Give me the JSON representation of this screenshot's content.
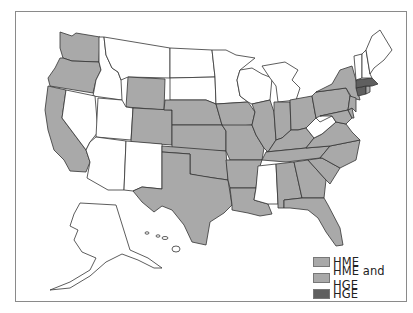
{
  "map": {
    "title": "",
    "region": "United States",
    "colors": {
      "none": "#ffffff",
      "HME": "#a9a9a9",
      "HME and HGE": "#a9a9a9",
      "HGE": "#5f5f5f",
      "border": "#333333"
    },
    "states_unshaded": [
      "MT",
      "ID",
      "NV",
      "UT",
      "AZ",
      "NM",
      "ND",
      "SD",
      "MN",
      "WI",
      "MI",
      "MS",
      "WV",
      "VT",
      "NH",
      "ME",
      "AK",
      "HI"
    ],
    "states_HGE": [
      "MA",
      "CT"
    ],
    "states_shaded_HME_or_both": [
      "WA",
      "OR",
      "CA",
      "WY",
      "CO",
      "NE",
      "KS",
      "OK",
      "TX",
      "IA",
      "MO",
      "AR",
      "LA",
      "IL",
      "IN",
      "OH",
      "KY",
      "TN",
      "AL",
      "GA",
      "FL",
      "SC",
      "NC",
      "VA",
      "PA",
      "NY",
      "NJ",
      "DE",
      "MD",
      "RI"
    ]
  },
  "legend": {
    "items": [
      {
        "label": "HME",
        "color": "#a9a9a9"
      },
      {
        "label": "HME and HGE",
        "color": "#a9a9a9"
      },
      {
        "label": "HGE",
        "color": "#5f5f5f"
      }
    ]
  }
}
